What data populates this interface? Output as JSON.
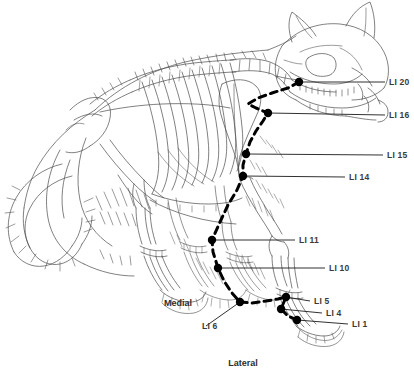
{
  "figure": {
    "background_color": "#ffffff",
    "line_color": "#4a4a4a",
    "meridian_color": "#000000",
    "point_color": "#000000",
    "label_color": "#3a3a3a"
  },
  "orientation_labels": [
    {
      "name": "medial",
      "text": "Medial",
      "x": 178,
      "y": 303
    },
    {
      "name": "lateral",
      "text": "Lateral",
      "x": 243,
      "y": 363
    }
  ],
  "acupoints": [
    {
      "id": "li20",
      "label": "LI 20",
      "point_x": 299,
      "point_y": 82,
      "leader_to_x": 385,
      "leader_to_y": 82,
      "label_x": 389,
      "label_y": 82
    },
    {
      "id": "li16",
      "label": "LI 16",
      "point_x": 268,
      "point_y": 113,
      "leader_to_x": 385,
      "leader_to_y": 115,
      "label_x": 389,
      "label_y": 115
    },
    {
      "id": "li15",
      "label": "LI 15",
      "point_x": 246,
      "point_y": 154,
      "leader_to_x": 383,
      "leader_to_y": 155,
      "label_x": 387,
      "label_y": 155
    },
    {
      "id": "li14",
      "label": "LI 14",
      "point_x": 243,
      "point_y": 176,
      "leader_to_x": 345,
      "leader_to_y": 177,
      "label_x": 349,
      "label_y": 177
    },
    {
      "id": "li11",
      "label": "LI 11",
      "point_x": 212,
      "point_y": 240,
      "leader_to_x": 295,
      "leader_to_y": 240,
      "label_x": 299,
      "label_y": 240
    },
    {
      "id": "li10",
      "label": "LI 10",
      "point_x": 218,
      "point_y": 268,
      "leader_to_x": 325,
      "leader_to_y": 268,
      "label_x": 329,
      "label_y": 268
    },
    {
      "id": "li6",
      "label": "LI 6",
      "point_x": 240,
      "point_y": 302,
      "leader_to_x": 206,
      "leader_to_y": 326,
      "label_x": 202,
      "label_y": 326
    },
    {
      "id": "li5",
      "label": "LI 5",
      "point_x": 286,
      "point_y": 297,
      "leader_to_x": 310,
      "leader_to_y": 301,
      "label_x": 314,
      "label_y": 301
    },
    {
      "id": "li4",
      "label": "LI 4",
      "point_x": 281,
      "point_y": 309,
      "leader_to_x": 322,
      "leader_to_y": 313,
      "label_x": 326,
      "label_y": 313
    },
    {
      "id": "li1",
      "label": "LI 1",
      "point_x": 297,
      "point_y": 320,
      "leader_to_x": 348,
      "leader_to_y": 324,
      "label_x": 352,
      "label_y": 324
    }
  ],
  "meridian_path": {
    "name": "large-intestine-meridian",
    "style": "dashed",
    "points": [
      [
        299,
        82
      ],
      [
        288,
        88
      ],
      [
        272,
        93
      ],
      [
        258,
        98
      ],
      [
        248,
        104
      ],
      [
        256,
        108
      ],
      [
        268,
        113
      ],
      [
        263,
        121
      ],
      [
        256,
        131
      ],
      [
        250,
        142
      ],
      [
        246,
        154
      ],
      [
        243,
        165
      ],
      [
        243,
        176
      ],
      [
        237,
        190
      ],
      [
        228,
        205
      ],
      [
        220,
        222
      ],
      [
        212,
        240
      ],
      [
        213,
        252
      ],
      [
        218,
        268
      ],
      [
        224,
        281
      ],
      [
        232,
        293
      ],
      [
        240,
        302
      ],
      [
        252,
        303
      ],
      [
        266,
        301
      ],
      [
        278,
        299
      ],
      [
        286,
        297
      ],
      [
        281,
        309
      ],
      [
        288,
        316
      ],
      [
        297,
        320
      ]
    ]
  }
}
